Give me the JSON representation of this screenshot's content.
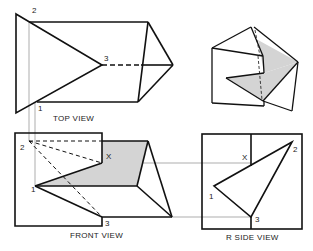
{
  "diagram": {
    "type": "orthographic-projection",
    "views": {
      "top": {
        "caption": "TOP VIEW",
        "points": {
          "p2": "2",
          "p3": "3",
          "p1": "1"
        }
      },
      "front": {
        "caption": "FRONT VIEW",
        "points": {
          "p2": "2",
          "p1": "1",
          "p3": "3",
          "x": "X"
        }
      },
      "right_side": {
        "caption": "R SIDE VIEW",
        "points": {
          "p2": "2",
          "p1": "1",
          "p3": "3",
          "x": "X"
        }
      },
      "pictorial": {
        "caption": ""
      }
    },
    "colors": {
      "line": "#111111",
      "construction": "#8a8a8a",
      "shade": "#d4d4d4",
      "background": "#ffffff"
    }
  }
}
